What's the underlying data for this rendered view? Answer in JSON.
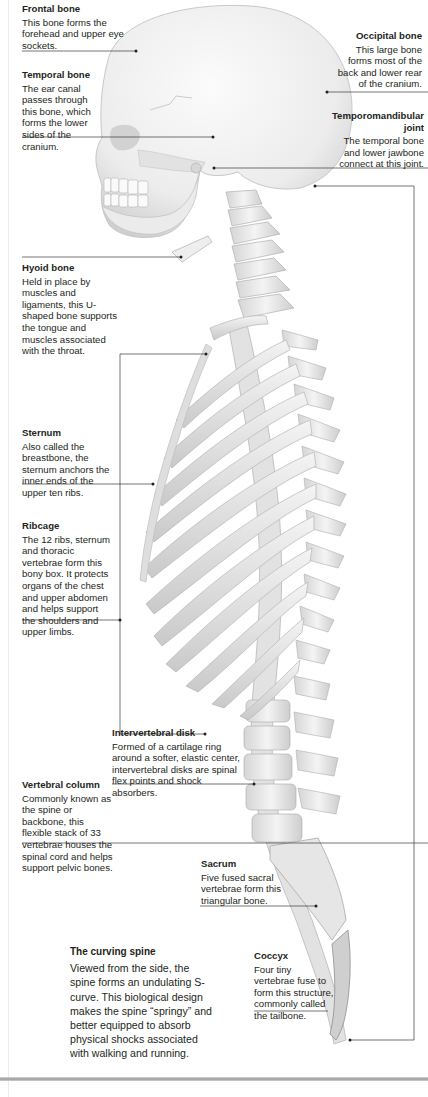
{
  "title": "The curving spine",
  "colors": {
    "text": "#231f20",
    "leader_line": "#3a3a3a",
    "bone": "#e9e9e9",
    "bone_shadow": "#bdbdbd"
  },
  "labels": {
    "frontal": {
      "title": "Frontal bone",
      "desc": "This bone forms the forehead and upper eye sockets."
    },
    "temporal": {
      "title": "Temporal bone",
      "desc": "The ear canal passes through this bone, which forms the lower sides of the cranium."
    },
    "occipital": {
      "title": "Occipital bone",
      "desc": "This large bone forms most of the back and lower rear of the cranium."
    },
    "tmj": {
      "title": "Temporomandibular joint",
      "desc": "The temporal bone and lower jawbone connect at this joint."
    },
    "hyoid": {
      "title": "Hyoid bone",
      "desc": "Held in place by muscles and ligaments, this U-shaped bone supports the tongue and muscles associated with the throat."
    },
    "sternum": {
      "title": "Sternum",
      "desc": "Also called the breastbone, the sternum anchors the inner ends of the upper ten ribs."
    },
    "ribcage": {
      "title": "Ribcage",
      "desc": "The 12 ribs, sternum and thoracic vertebrae form this bony box. It protects organs of the chest and upper abdomen and helps support the shoulders and upper limbs."
    },
    "disk": {
      "title": "Intervertebral disk",
      "desc": "Formed of a cartilage ring around a softer, elastic center, intervertebral disks are spinal flex points and shock absorbers."
    },
    "vertebral": {
      "title": "Vertebral column",
      "desc": "Commonly known as the spine or backbone, this flexible stack of 33 vertebrae houses the spinal cord and helps support pelvic bones."
    },
    "sacrum": {
      "title": "Sacrum",
      "desc": "Five fused sacral vertebrae form this triangular bone."
    },
    "coccyx": {
      "title": "Coccyx",
      "desc": "Four tiny vertebrae fuse to form this structure, commonly called the tailbone."
    },
    "curving": {
      "title": "The curving spine",
      "desc": "Viewed from the side, the spine forms an undulating S-curve. This biological design makes the spine “springy” and better equipped to absorb physical shocks associated with walking and running."
    }
  }
}
